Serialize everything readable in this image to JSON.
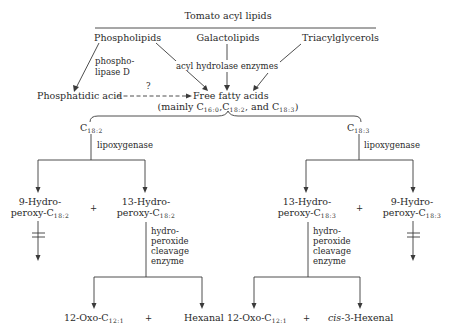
{
  "diagram": {
    "title": "Tomato acyl lipids",
    "sources": {
      "phospholipids": "Phospholipids",
      "galactolipids": "Galactolipids",
      "triacylglycerols": "Triacylglycerols"
    },
    "enzymes": {
      "phospholipase_line1": "phospho-",
      "phospholipase_line2": "lipase D",
      "acyl_hydrolase": "acyl hydrolase enzymes",
      "lipoxygenase_left": "lipoxygenase",
      "lipoxygenase_right": "lipoxygenase",
      "cleavage_left": [
        "hydro-",
        "peroxide",
        "cleavage",
        "enzyme"
      ],
      "cleavage_right": [
        "hydro-",
        "peroxide",
        "cleavage",
        "enzyme"
      ]
    },
    "phosphatidic_acid": "Phosphatidic acid",
    "unknown_step": "?",
    "free_fatty_acids": {
      "label": "Free fatty acids",
      "note_prefix": "(mainly C",
      "sub1": "16:0",
      "sep1": ",C",
      "sub2": "18:2",
      "sep2": ", and C",
      "sub3": "18:3",
      "note_suffix": ")"
    },
    "branches": {
      "left": {
        "substrate": {
          "base": "C",
          "sub": "18:2"
        },
        "hydroperoxide_9": {
          "line1": "9-Hydro-",
          "line2": "peroxy-C",
          "sub": "18:2"
        },
        "hydroperoxide_13": {
          "line1": "13-Hydro-",
          "line2": "peroxy-C",
          "sub": "18:2"
        },
        "plus_top": "+",
        "product_1": {
          "base": "12-Oxo-C",
          "sub": "12:1"
        },
        "plus_bottom": "+",
        "product_2": "Hexanal"
      },
      "right": {
        "substrate": {
          "base": "C",
          "sub": "18:3"
        },
        "hydroperoxide_13": {
          "line1": "13-Hydro-",
          "line2": "peroxy-C",
          "sub": "18:3"
        },
        "hydroperoxide_9": {
          "line1": "9-Hydro-",
          "line2": "peroxy-C",
          "sub": "18:3"
        },
        "plus_top": "+",
        "product_1": {
          "base": "12-Oxo-C",
          "sub": "12:1"
        },
        "plus_bottom": "+",
        "product_2_prefix": "cis",
        "product_2_rest": "-3-Hexenal"
      }
    }
  }
}
